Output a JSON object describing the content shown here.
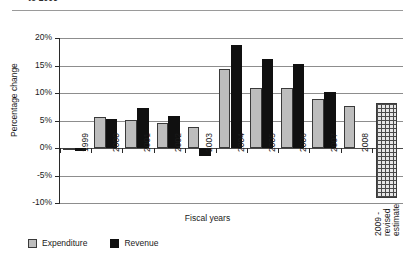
{
  "figure": {
    "heading_clipped": "to 2009",
    "x_axis_title": "Fiscal years",
    "y_axis_title": "Percentage change"
  },
  "legend": {
    "position": "bottom-left",
    "items": [
      {
        "label": "Expenditure",
        "color": "#bdbdbd"
      },
      {
        "label": "Revenue",
        "color": "#101010"
      }
    ]
  },
  "axis": {
    "y_ticks": [
      "20%",
      "15%",
      "10%",
      "5%",
      "0%",
      "-5%",
      "-10%"
    ],
    "y_values": [
      20,
      15,
      10,
      5,
      0,
      -5,
      -10
    ]
  },
  "projection": {
    "label_line1": "2009 -",
    "label_line2": "revised",
    "label_line3": "estimate"
  },
  "chart_data": {
    "type": "bar",
    "title": "to 2009",
    "xlabel": "Fiscal years",
    "ylabel": "Percentage change",
    "ylim": [
      -10,
      20
    ],
    "ytick_step": 5,
    "grid": true,
    "legend_position": "bottom-left",
    "categories": [
      "1999",
      "2000",
      "2001",
      "2002",
      "2003",
      "2004",
      "2005",
      "2006",
      "2007",
      "2008",
      "2009 - revised estimate"
    ],
    "series": [
      {
        "name": "Expenditure",
        "color": "#bdbdbd",
        "values": [
          -0.4,
          5.6,
          5.1,
          4.6,
          3.8,
          14.4,
          11.0,
          11.0,
          9.0,
          7.7,
          null
        ]
      },
      {
        "name": "Revenue",
        "color": "#101010",
        "values": [
          -0.5,
          5.3,
          7.3,
          5.9,
          -1.5,
          18.7,
          16.2,
          15.2,
          10.1,
          null,
          null
        ]
      }
    ],
    "annotations": [
      {
        "category": "2009 - revised estimate",
        "style": "cross-hatched column",
        "note": "no bar values plotted"
      }
    ]
  }
}
